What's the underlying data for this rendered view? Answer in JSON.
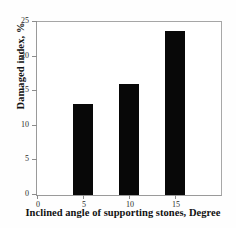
{
  "chart_data": {
    "type": "bar",
    "title": "",
    "xlabel": "Inclined angle of supporting stones, Degree",
    "ylabel": "Damaged index, %",
    "categories": [
      "5",
      "10",
      "15"
    ],
    "x": [
      5,
      10,
      15
    ],
    "values": [
      13.2,
      16.1,
      23.7
    ],
    "series": [
      {
        "name": "Damaged index",
        "values": [
          13.2,
          16.1,
          23.7
        ],
        "color": "#080808"
      }
    ],
    "xlim": [
      0,
      20
    ],
    "ylim": [
      0,
      25
    ],
    "xticks": [
      0,
      5,
      10,
      15
    ],
    "xtick_labels": [
      "0",
      "5",
      "10",
      "15"
    ],
    "yticks": [
      0,
      5,
      10,
      15,
      20,
      25
    ],
    "ytick_labels": [
      "0",
      "5",
      "10",
      "15",
      "20",
      "25"
    ],
    "grid": false,
    "legend": "none",
    "bar_width": 2.2,
    "bar_color": "#080808",
    "frame_color": "#9a9a9a",
    "background": "#ffffff"
  }
}
